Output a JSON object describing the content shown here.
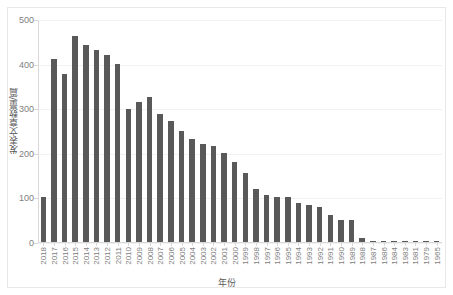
{
  "chart_data": {
    "type": "bar",
    "title": "",
    "xlabel": "年份",
    "ylabel": "发表文章数量/篇",
    "ylim": [
      0,
      500
    ],
    "yticks": [
      0,
      100,
      200,
      300,
      400,
      500
    ],
    "grid": true,
    "legend": null,
    "bar_color": "#595959",
    "axis_color": "#d9d9d9",
    "tick_label_color": "#808080",
    "categories": [
      "2018",
      "2017",
      "2016",
      "2015",
      "2014",
      "2013",
      "2012",
      "2011",
      "2010",
      "2009",
      "2008",
      "2007",
      "2006",
      "2005",
      "2004",
      "2003",
      "2002",
      "2001",
      "2000",
      "1999",
      "1998",
      "1997",
      "1996",
      "1995",
      "1994",
      "1993",
      "1992",
      "1991",
      "1990",
      "1989",
      "1988",
      "1987",
      "1986",
      "1984",
      "1983",
      "1981",
      "1979",
      "1965"
    ],
    "values": [
      100,
      411,
      376,
      461,
      442,
      430,
      420,
      399,
      298,
      315,
      325,
      288,
      272,
      250,
      232,
      220,
      215,
      200,
      180,
      155,
      118,
      105,
      100,
      100,
      88,
      82,
      78,
      60,
      50,
      50,
      10,
      3,
      3,
      3,
      3,
      3,
      3,
      3
    ]
  }
}
